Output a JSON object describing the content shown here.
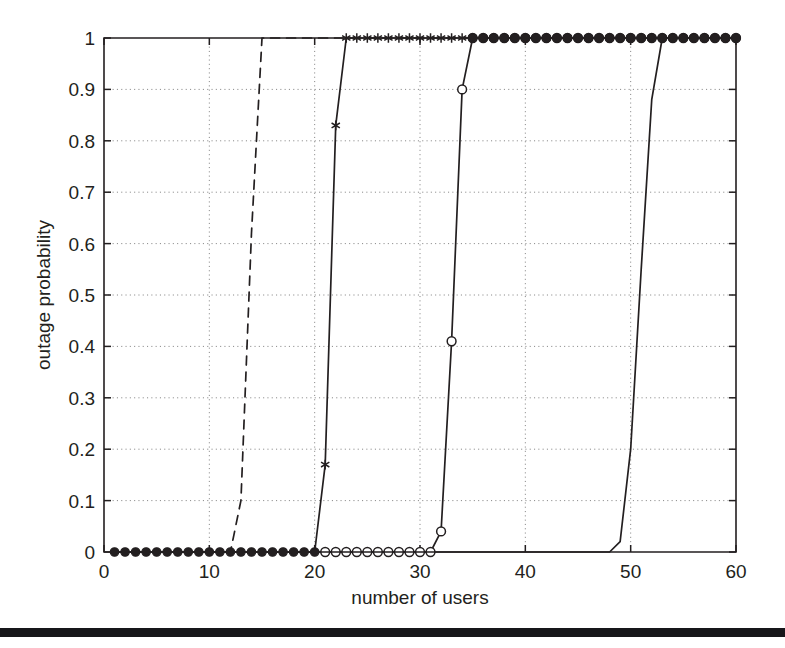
{
  "figure": {
    "background_color": "#ffffff",
    "ink_color": "#231f20",
    "grid_color": "#7d7d7d"
  },
  "scan_artifact": {
    "name": "page-edge-bar",
    "top_px": 628,
    "height_px": 9,
    "color": "#17161a"
  },
  "chart_data": {
    "type": "line",
    "title": "",
    "subtitle": "",
    "xlabel": "number of users",
    "ylabel": "outage probability",
    "xlim": [
      0,
      60
    ],
    "ylim": [
      0,
      1
    ],
    "xticks": [
      0,
      10,
      20,
      30,
      40,
      50,
      60
    ],
    "xticklabels": [
      "0",
      "10",
      "20",
      "30",
      "40",
      "50",
      "60"
    ],
    "yticks": [
      0,
      0.1,
      0.2,
      0.3,
      0.4,
      0.5,
      0.6,
      0.7,
      0.8,
      0.9,
      1
    ],
    "yticklabels": [
      "0",
      "0.1",
      "0.2",
      "0.3",
      "0.4",
      "0.5",
      "0.6",
      "0.7",
      "0.8",
      "0.9",
      "1"
    ],
    "grid": true,
    "grid_style": "dotted",
    "legend": null,
    "legend_position": "none",
    "annotations": [],
    "series": [
      {
        "name": "series-1-dashed",
        "linestyle": "dashed",
        "marker": "none",
        "color": "#231f20",
        "x": [
          1,
          2,
          3,
          4,
          5,
          6,
          7,
          8,
          9,
          10,
          11,
          12,
          13,
          14,
          15,
          16,
          17,
          18,
          19,
          20,
          21,
          22,
          23,
          24,
          25,
          26,
          27,
          28,
          29,
          30,
          31,
          32,
          33,
          34,
          35,
          36,
          37,
          38,
          39,
          40,
          41,
          42,
          43,
          44,
          45,
          46,
          47,
          48,
          49,
          50,
          51,
          52,
          53,
          54,
          55,
          56,
          57,
          58,
          59,
          60
        ],
        "y": [
          0,
          0,
          0,
          0,
          0,
          0,
          0,
          0,
          0,
          0,
          0,
          0,
          0.1,
          0.62,
          1,
          1,
          1,
          1,
          1,
          1,
          1,
          1,
          1,
          1,
          1,
          1,
          1,
          1,
          1,
          1,
          1,
          1,
          1,
          1,
          1,
          1,
          1,
          1,
          1,
          1,
          1,
          1,
          1,
          1,
          1,
          1,
          1,
          1,
          1,
          1,
          1,
          1,
          1,
          1,
          1,
          1,
          1,
          1,
          1,
          1
        ]
      },
      {
        "name": "series-2-star",
        "linestyle": "solid",
        "marker": "star",
        "color": "#231f20",
        "x": [
          1,
          2,
          3,
          4,
          5,
          6,
          7,
          8,
          9,
          10,
          11,
          12,
          13,
          14,
          15,
          16,
          17,
          18,
          19,
          20,
          21,
          22,
          23,
          24,
          25,
          26,
          27,
          28,
          29,
          30,
          31,
          32,
          33,
          34,
          35,
          36,
          37,
          38,
          39,
          40,
          41,
          42,
          43,
          44,
          45,
          46,
          47,
          48,
          49,
          50,
          51,
          52,
          53,
          54,
          55,
          56,
          57,
          58,
          59,
          60
        ],
        "y": [
          0,
          0,
          0,
          0,
          0,
          0,
          0,
          0,
          0,
          0,
          0,
          0,
          0,
          0,
          0,
          0,
          0,
          0,
          0,
          0,
          0.17,
          0.83,
          1,
          1,
          1,
          1,
          1,
          1,
          1,
          1,
          1,
          1,
          1,
          1,
          1,
          1,
          1,
          1,
          1,
          1,
          1,
          1,
          1,
          1,
          1,
          1,
          1,
          1,
          1,
          1,
          1,
          1,
          1,
          1,
          1,
          1,
          1,
          1,
          1,
          1
        ],
        "marker_x": [
          21,
          22,
          23,
          24,
          25,
          26,
          27,
          28,
          29,
          30,
          31,
          32,
          33,
          34,
          35,
          36,
          37,
          38,
          39,
          40,
          41,
          42,
          43,
          44,
          45,
          46,
          47,
          48,
          49,
          50,
          51,
          52,
          53,
          54,
          55,
          56,
          57,
          58,
          59,
          60
        ],
        "marker_y": [
          0.17,
          0.83,
          1,
          1,
          1,
          1,
          1,
          1,
          1,
          1,
          1,
          1,
          1,
          1,
          1,
          1,
          1,
          1,
          1,
          1,
          1,
          1,
          1,
          1,
          1,
          1,
          1,
          1,
          1,
          1,
          1,
          1,
          1,
          1,
          1,
          1,
          1,
          1,
          1,
          1
        ]
      },
      {
        "name": "series-3-open-circle",
        "linestyle": "solid",
        "marker": "circle-open",
        "color": "#231f20",
        "x": [
          1,
          2,
          3,
          4,
          5,
          6,
          7,
          8,
          9,
          10,
          11,
          12,
          13,
          14,
          15,
          16,
          17,
          18,
          19,
          20,
          21,
          22,
          23,
          24,
          25,
          26,
          27,
          28,
          29,
          30,
          31,
          32,
          33,
          34,
          35,
          36,
          37,
          38,
          39,
          40,
          41,
          42,
          43,
          44,
          45,
          46,
          47,
          48,
          49,
          50,
          51,
          52,
          53,
          54,
          55,
          56,
          57,
          58,
          59,
          60
        ],
        "y": [
          0,
          0,
          0,
          0,
          0,
          0,
          0,
          0,
          0,
          0,
          0,
          0,
          0,
          0,
          0,
          0,
          0,
          0,
          0,
          0,
          0,
          0,
          0,
          0,
          0,
          0,
          0,
          0,
          0,
          0,
          0,
          0.04,
          0.41,
          0.9,
          1,
          1,
          1,
          1,
          1,
          1,
          1,
          1,
          1,
          1,
          1,
          1,
          1,
          1,
          1,
          1,
          1,
          1,
          1,
          1,
          1,
          1,
          1,
          1,
          1,
          1
        ],
        "marker_x": [
          21,
          22,
          23,
          24,
          25,
          26,
          27,
          28,
          29,
          30,
          31,
          32,
          33,
          34,
          35,
          36,
          37,
          38,
          39,
          40,
          41,
          42,
          43,
          44,
          45,
          46,
          47,
          48,
          49,
          50,
          51,
          52,
          53,
          54,
          55,
          56,
          57,
          58,
          59,
          60
        ],
        "marker_y": [
          0,
          0,
          0,
          0,
          0,
          0,
          0,
          0,
          0,
          0,
          0,
          0.04,
          0.41,
          0.9,
          1,
          1,
          1,
          1,
          1,
          1,
          1,
          1,
          1,
          1,
          1,
          1,
          1,
          1,
          1,
          1,
          1,
          1,
          1,
          1,
          1,
          1,
          1,
          1,
          1,
          1
        ]
      },
      {
        "name": "series-4-solid",
        "linestyle": "solid",
        "marker": "none",
        "color": "#231f20",
        "x": [
          1,
          2,
          3,
          4,
          5,
          6,
          7,
          8,
          9,
          10,
          11,
          12,
          13,
          14,
          15,
          16,
          17,
          18,
          19,
          20,
          21,
          22,
          23,
          24,
          25,
          26,
          27,
          28,
          29,
          30,
          31,
          32,
          33,
          34,
          35,
          36,
          37,
          38,
          39,
          40,
          41,
          42,
          43,
          44,
          45,
          46,
          47,
          48,
          49,
          50,
          51,
          52,
          53,
          54,
          55,
          56,
          57,
          58,
          59,
          60
        ],
        "y": [
          0,
          0,
          0,
          0,
          0,
          0,
          0,
          0,
          0,
          0,
          0,
          0,
          0,
          0,
          0,
          0,
          0,
          0,
          0,
          0,
          0,
          0,
          0,
          0,
          0,
          0,
          0,
          0,
          0,
          0,
          0,
          0,
          0,
          0,
          0,
          0,
          0,
          0,
          0,
          0,
          0,
          0,
          0,
          0,
          0,
          0,
          0,
          0,
          0.02,
          0.2,
          0.55,
          0.88,
          1,
          1,
          1,
          1,
          1,
          1,
          1,
          1
        ]
      },
      {
        "name": "baseline-filled-circles",
        "linestyle": "none",
        "marker": "circle-filled",
        "color": "#231f20",
        "marker_x": [
          1,
          2,
          3,
          4,
          5,
          6,
          7,
          8,
          9,
          10,
          11,
          12,
          13,
          14,
          15,
          16,
          17,
          18,
          19,
          20
        ],
        "marker_y": [
          0,
          0,
          0,
          0,
          0,
          0,
          0,
          0,
          0,
          0,
          0,
          0,
          0,
          0,
          0,
          0,
          0,
          0,
          0,
          0
        ]
      },
      {
        "name": "top-filled-circles",
        "linestyle": "none",
        "marker": "circle-filled",
        "color": "#231f20",
        "marker_x": [
          35,
          36,
          37,
          38,
          39,
          40,
          41,
          42,
          43,
          44,
          45,
          46,
          47,
          48,
          49,
          50,
          51,
          52,
          53,
          54,
          55,
          56,
          57,
          58,
          59,
          60
        ],
        "marker_y": [
          1,
          1,
          1,
          1,
          1,
          1,
          1,
          1,
          1,
          1,
          1,
          1,
          1,
          1,
          1,
          1,
          1,
          1,
          1,
          1,
          1,
          1,
          1,
          1,
          1,
          1
        ]
      }
    ]
  }
}
